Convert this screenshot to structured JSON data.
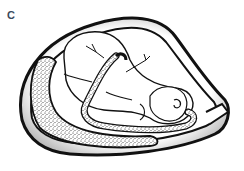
{
  "figure": {
    "panel_label": "C",
    "elements": [
      {
        "name": "uterine-wall",
        "style": "double black outline"
      },
      {
        "name": "fetus",
        "style": "white line drawing, curled, head at right"
      },
      {
        "name": "umbilical-cord",
        "style": "coiled band with stippled fill"
      },
      {
        "name": "placenta",
        "style": "crescent with dense stipple"
      }
    ],
    "colors": {
      "label": "#3a4a5c",
      "line": "#111111",
      "background": "#ffffff",
      "shadow": "#9a9a9a"
    }
  }
}
